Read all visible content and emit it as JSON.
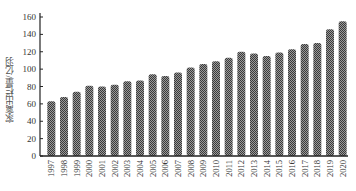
{
  "chart_data": {
    "type": "bar",
    "title": "",
    "xlabel": "",
    "ylabel": "家禽出栏量/亿羽",
    "ylim": [
      0,
      160
    ],
    "yticks": [
      0,
      20,
      40,
      60,
      80,
      100,
      120,
      140,
      160
    ],
    "grid": false,
    "legend": null,
    "bar_fill": "hatched dark gray",
    "categories": [
      "1997",
      "1998",
      "1999",
      "2000",
      "2001",
      "2002",
      "2003",
      "2004",
      "2005",
      "2006",
      "2007",
      "2008",
      "2009",
      "2010",
      "2011",
      "2012",
      "2013",
      "2014",
      "2015",
      "2016",
      "2017",
      "2018",
      "2019",
      "2020"
    ],
    "values": [
      63,
      68,
      74,
      81,
      80,
      82,
      86,
      87,
      94,
      92,
      96,
      102,
      106,
      109,
      113,
      120,
      118,
      115,
      119,
      123,
      129,
      130,
      146,
      155
    ]
  },
  "colors": {
    "bar_dark": "#3a3a3a",
    "bar_light": "#9a9a9a",
    "axis": "#222222",
    "text": "#333333"
  }
}
